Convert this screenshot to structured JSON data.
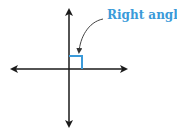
{
  "diagram": {
    "label": "Right angle",
    "colors": {
      "lines": "#1a1a1a",
      "accent": "#3a9ad9"
    }
  }
}
